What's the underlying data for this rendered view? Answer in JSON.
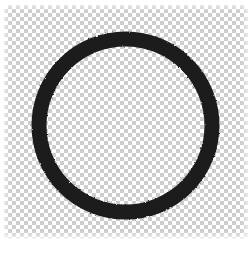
{
  "image": {
    "title": "Transparent Ring Graphic",
    "width": 252,
    "height": 254,
    "background_type": "transparency-checkerboard",
    "caption_artifact": ""
  },
  "checkerboard": {
    "light_color": "#ffffff",
    "dark_color": "#cdcdcd",
    "square_size_px": 4,
    "region": {
      "left": 4,
      "top": 5,
      "width": 244,
      "height": 234
    }
  },
  "ring": {
    "shape_name": "annulus",
    "fill_color": "#1b1b1b",
    "center_x": 125,
    "center_y": 125,
    "outer_radius": 94,
    "inner_radius": 79,
    "stroke_width_px": 15,
    "interior": "transparent",
    "texture": "rough-rasterized"
  }
}
